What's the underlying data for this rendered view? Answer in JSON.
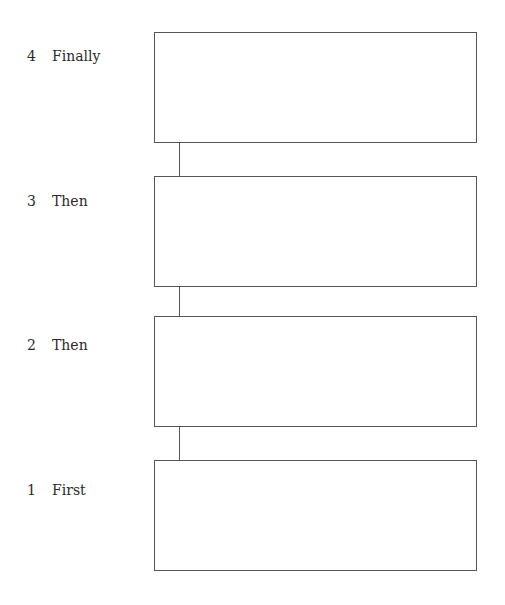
{
  "diagram": {
    "type": "sequence-flow",
    "steps": [
      {
        "number": "4",
        "label": "Finally",
        "content": ""
      },
      {
        "number": "3",
        "label": "Then",
        "content": ""
      },
      {
        "number": "2",
        "label": "Then",
        "content": ""
      },
      {
        "number": "1",
        "label": "First",
        "content": ""
      }
    ]
  }
}
